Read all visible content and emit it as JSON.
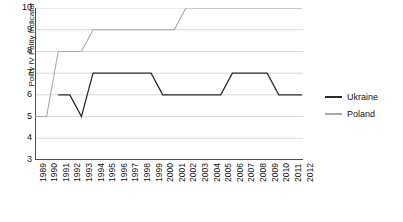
{
  "chart_data": {
    "type": "line",
    "title": "",
    "xlabel": "",
    "ylabel": "Polity IV Polity Indicator",
    "ylim": [
      3,
      10
    ],
    "yticks": [
      3,
      4,
      5,
      6,
      7,
      8,
      9,
      10
    ],
    "grid": true,
    "legend_position": "right",
    "x": [
      1989,
      1990,
      1991,
      1992,
      1993,
      1994,
      1995,
      1996,
      1997,
      1998,
      1999,
      2000,
      2001,
      2002,
      2003,
      2004,
      2005,
      2006,
      2007,
      2008,
      2009,
      2010,
      2011,
      2012
    ],
    "categories": [
      "1989",
      "1990",
      "1991",
      "1992",
      "1993",
      "1994",
      "1995",
      "1996",
      "1997",
      "1998",
      "1999",
      "2000",
      "2001",
      "2002",
      "2003",
      "2004",
      "2005",
      "2006",
      "2007",
      "2008",
      "2009",
      "2010",
      "2011",
      "2012"
    ],
    "series": [
      {
        "name": "Ukraine",
        "color": "#2b2b2b",
        "values": [
          null,
          null,
          6,
          6,
          5,
          7,
          7,
          7,
          7,
          7,
          7,
          6,
          6,
          6,
          6,
          6,
          6,
          7,
          7,
          7,
          7,
          6,
          6,
          6
        ]
      },
      {
        "name": "Poland",
        "color": "#a8a8a8",
        "values": [
          5,
          5,
          8,
          8,
          8,
          9,
          9,
          9,
          9,
          9,
          9,
          9,
          9,
          10,
          10,
          10,
          10,
          10,
          10,
          10,
          10,
          10,
          10,
          10
        ]
      }
    ]
  },
  "legend": {
    "items": [
      {
        "label": "Ukraine",
        "color": "#2b2b2b"
      },
      {
        "label": "Poland",
        "color": "#a8a8a8"
      }
    ]
  },
  "axes": {
    "y_title": "Polity IV Polity Indicator",
    "y_tick_labels": [
      "10",
      "9",
      "8",
      "7",
      "6",
      "5",
      "4",
      "3"
    ],
    "x_tick_labels": [
      "1989",
      "1990",
      "1991",
      "1992",
      "1993",
      "1994",
      "1995",
      "1996",
      "1997",
      "1998",
      "1999",
      "2000",
      "2001",
      "2002",
      "2003",
      "2004",
      "2005",
      "2006",
      "2007",
      "2008",
      "2009",
      "2010",
      "2011",
      "2012"
    ]
  },
  "style": {
    "grid_color": "#d9d9d9",
    "axis_color": "#4d4d4d",
    "background": "#ffffff"
  }
}
